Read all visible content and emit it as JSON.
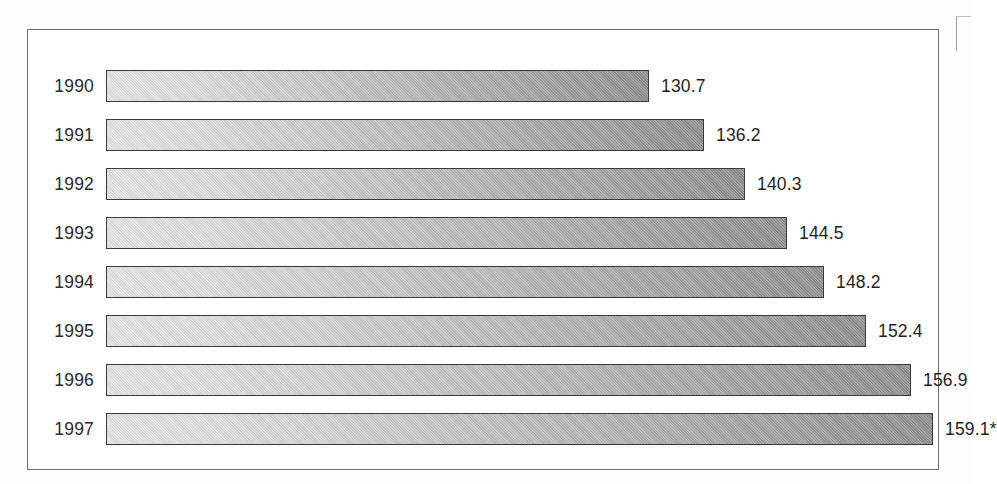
{
  "frame": {
    "border_color": "#6f6f6f",
    "background": "#ffffff"
  },
  "chart_data": {
    "type": "bar",
    "orientation": "horizontal",
    "title": "",
    "subtitle": "",
    "xlabel": "",
    "ylabel": "",
    "grid": false,
    "legend": null,
    "axis_visible": false,
    "tick_labels_visible": false,
    "data_labels_visible": true,
    "categories": [
      "1990",
      "1991",
      "1992",
      "1993",
      "1994",
      "1995",
      "1996",
      "1997"
    ],
    "values": [
      130.7,
      136.2,
      140.3,
      144.5,
      148.2,
      152.4,
      156.9,
      159.1
    ],
    "value_labels": [
      "130.7",
      "136.2",
      "140.3",
      "144.5",
      "148.2",
      "152.4",
      "156.9",
      "159.1*"
    ],
    "annotations": [
      "159.1* carries an asterisk denoting a preliminary or estimated figure"
    ],
    "bar_style": {
      "fill": "horizontal-gradient",
      "fill_from": "#e3e3e3",
      "fill_to": "#8f8f8f",
      "border_color": "#3a3a3a"
    },
    "xlim": [
      0,
      170
    ],
    "bar_axis_origin": 0
  },
  "bars": [
    {
      "year": "1990",
      "value": 130.7,
      "label": "130.7",
      "width_px": 543
    },
    {
      "year": "1991",
      "value": 136.2,
      "label": "136.2",
      "width_px": 598
    },
    {
      "year": "1992",
      "value": 140.3,
      "label": "140.3",
      "width_px": 639
    },
    {
      "year": "1993",
      "value": 144.5,
      "label": "144.5",
      "width_px": 681
    },
    {
      "year": "1994",
      "value": 148.2,
      "label": "148.2",
      "width_px": 718
    },
    {
      "year": "1995",
      "value": 152.4,
      "label": "152.4",
      "width_px": 760
    },
    {
      "year": "1996",
      "value": 156.9,
      "label": "156.9",
      "width_px": 805
    },
    {
      "year": "1997",
      "value": 159.1,
      "label": "159.1*",
      "width_px": 827
    }
  ]
}
